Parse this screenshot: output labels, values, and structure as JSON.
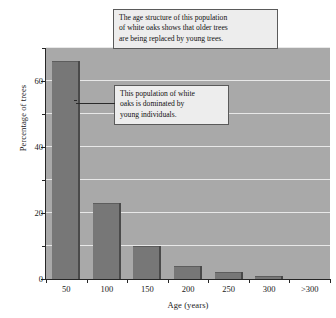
{
  "chart_data": {
    "type": "bar",
    "title": "",
    "xlabel": "Age (years)",
    "ylabel": "Percentage of trees",
    "categories": [
      "50",
      "100",
      "150",
      "200",
      "250",
      "300",
      ">300"
    ],
    "values": [
      66,
      23,
      10,
      4,
      2,
      1,
      0
    ],
    "ylim": [
      0,
      70
    ],
    "yticks_major": [
      0,
      20,
      40,
      60
    ],
    "yticks_minor": [
      10,
      30,
      50,
      70
    ],
    "ytick_labels": [
      "0",
      "20",
      "40",
      "60"
    ],
    "grid": true,
    "gridlines_at": [
      10,
      20,
      30,
      40,
      50,
      60,
      70
    ],
    "legend": "none",
    "series": [
      {
        "name": "Percentage of trees",
        "values": [
          66,
          23,
          10,
          4,
          2,
          1,
          0
        ]
      }
    ],
    "annotations": [
      "The age structure of this population of white oaks shows that older trees are being replaced by young trees.",
      "This population of white oaks is dominated by young individuals."
    ],
    "colors": {
      "bar": "#777777",
      "bar_edge": "#4a4a4a",
      "plot_background": "#a9a9a9",
      "gridline": "#e8e8e8",
      "axis": "#262626",
      "callout_background": "#ededed",
      "callout_border": "#5a5a5a",
      "text": "#111111"
    }
  },
  "axes": {
    "y_title": "Percentage of trees",
    "x_title": "Age (years)",
    "y_labels": [
      "0",
      "20",
      "40",
      "60"
    ],
    "x_labels": [
      "50",
      "100",
      "150",
      "200",
      "250",
      "300",
      ">300"
    ]
  },
  "annotations": {
    "top": {
      "line1": "The age structure of this population",
      "line2": "of white oaks shows that older trees",
      "line3": "are being replaced by young trees."
    },
    "middle": {
      "line1": "This population of white",
      "line2": "oaks is dominated by",
      "line3": "young individuals."
    }
  }
}
